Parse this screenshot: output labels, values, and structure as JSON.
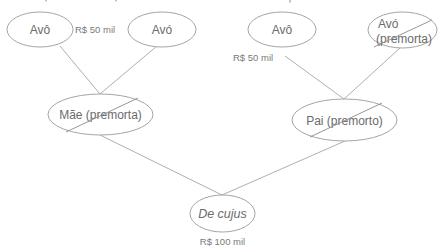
{
  "diagram": {
    "type": "family-tree",
    "colors": {
      "line": "#a6a6a6",
      "text": "#6b6b6b",
      "ellipse_stroke": "#9a9a9a"
    },
    "nodes": [
      {
        "id": "avo_materno",
        "label": "Avô",
        "premorto": false,
        "value": "R$ 50 mil"
      },
      {
        "id": "avo_materna",
        "label": "Avó",
        "premorto": false
      },
      {
        "id": "avo_paterno",
        "label": "Avô",
        "premorto": false,
        "value": "R$ 50 mil"
      },
      {
        "id": "avo_paterna",
        "label_line1": "Avó",
        "label_line2": "(premorta)",
        "premorto": true
      },
      {
        "id": "mae",
        "label": "Mãe (premorta)",
        "premorto": true
      },
      {
        "id": "pai",
        "label": "Pai (premorto)",
        "premorto": true
      },
      {
        "id": "de_cujus",
        "label": "De cujus",
        "premorto": false,
        "value": "R$ 100 mil"
      }
    ],
    "edges": [
      {
        "from": "avo_materno",
        "to": "mae"
      },
      {
        "from": "avo_materna",
        "to": "mae"
      },
      {
        "from": "avo_paterno",
        "to": "pai"
      },
      {
        "from": "avo_paterna",
        "to": "pai"
      },
      {
        "from": "mae",
        "to": "de_cujus"
      },
      {
        "from": "pai",
        "to": "de_cujus"
      }
    ]
  }
}
